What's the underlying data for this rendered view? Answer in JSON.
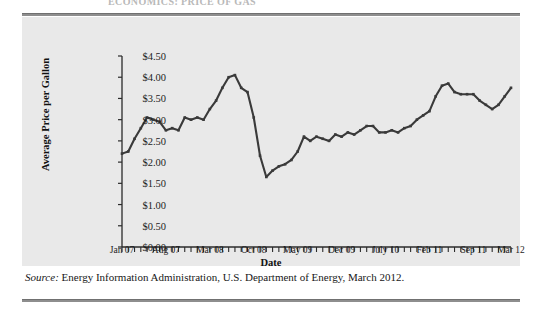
{
  "cutoff_title": "ECONOMICS: PRICE OF GAS",
  "source": {
    "label": "Source:",
    "text": " Energy Information Administration, U.S. Department of Energy, March 2012."
  },
  "colors": {
    "panel": "#e9e9e9",
    "line": "#3a3a3a",
    "axis": "#2b2b2b",
    "rule": "#8e8e8e"
  },
  "chart_data": {
    "type": "line",
    "title": "",
    "xlabel": "Date",
    "ylabel": "Average Price per Gallon",
    "ylim": [
      0.0,
      4.5
    ],
    "ytick_step": 0.5,
    "ytick_labels": [
      "$0.00",
      "$0.50",
      "$1.00",
      "$1.50",
      "$2.00",
      "$2.50",
      "$3.00",
      "$3.50",
      "$4.00",
      "$4.50"
    ],
    "ytick_values": [
      0.0,
      0.5,
      1.0,
      1.5,
      2.0,
      2.5,
      3.0,
      3.5,
      4.0,
      4.5
    ],
    "grid": false,
    "legend": "none",
    "xtick_labels": [
      "Jan 07",
      "Aug 07",
      "Mar 08",
      "Oct 08",
      "May 09",
      "Dec 09",
      "July 10",
      "Feb 11",
      "Sep 11",
      "Mar 12"
    ],
    "xtick_indices": [
      0,
      7,
      14,
      21,
      28,
      35,
      42,
      49,
      56,
      62
    ],
    "x_minor_ticks_monthly": true,
    "x": [
      "Jan 07",
      "Feb 07",
      "Mar 07",
      "Apr 07",
      "May 07",
      "Jun 07",
      "Jul 07",
      "Aug 07",
      "Sep 07",
      "Oct 07",
      "Nov 07",
      "Dec 07",
      "Jan 08",
      "Feb 08",
      "Mar 08",
      "Apr 08",
      "May 08",
      "Jun 08",
      "Jul 08",
      "Aug 08",
      "Sep 08",
      "Oct 08",
      "Nov 08",
      "Dec 08",
      "Jan 09",
      "Feb 09",
      "Mar 09",
      "Apr 09",
      "May 09",
      "Jun 09",
      "Jul 09",
      "Aug 09",
      "Sep 09",
      "Oct 09",
      "Nov 09",
      "Dec 09",
      "Jan 10",
      "Feb 10",
      "Mar 10",
      "Apr 10",
      "May 10",
      "Jun 10",
      "Jul 10",
      "Aug 10",
      "Sep 10",
      "Oct 10",
      "Nov 10",
      "Dec 10",
      "Jan 11",
      "Feb 11",
      "Mar 11",
      "Apr 11",
      "May 11",
      "Jun 11",
      "Jul 11",
      "Aug 11",
      "Sep 11",
      "Oct 11",
      "Nov 11",
      "Dec 11",
      "Jan 12",
      "Feb 12",
      "Mar 12"
    ],
    "values": [
      2.2,
      2.25,
      2.55,
      2.8,
      3.05,
      3.0,
      2.95,
      2.75,
      2.8,
      2.75,
      3.05,
      3.0,
      3.05,
      3.0,
      3.25,
      3.45,
      3.75,
      4.0,
      4.05,
      3.75,
      3.65,
      3.05,
      2.15,
      1.65,
      1.8,
      1.9,
      1.95,
      2.05,
      2.25,
      2.6,
      2.5,
      2.6,
      2.55,
      2.5,
      2.65,
      2.6,
      2.7,
      2.65,
      2.75,
      2.85,
      2.85,
      2.7,
      2.7,
      2.75,
      2.7,
      2.8,
      2.85,
      3.0,
      3.1,
      3.2,
      3.55,
      3.8,
      3.85,
      3.65,
      3.6,
      3.6,
      3.6,
      3.45,
      3.35,
      3.25,
      3.35,
      3.55,
      3.75
    ],
    "annotations": []
  }
}
